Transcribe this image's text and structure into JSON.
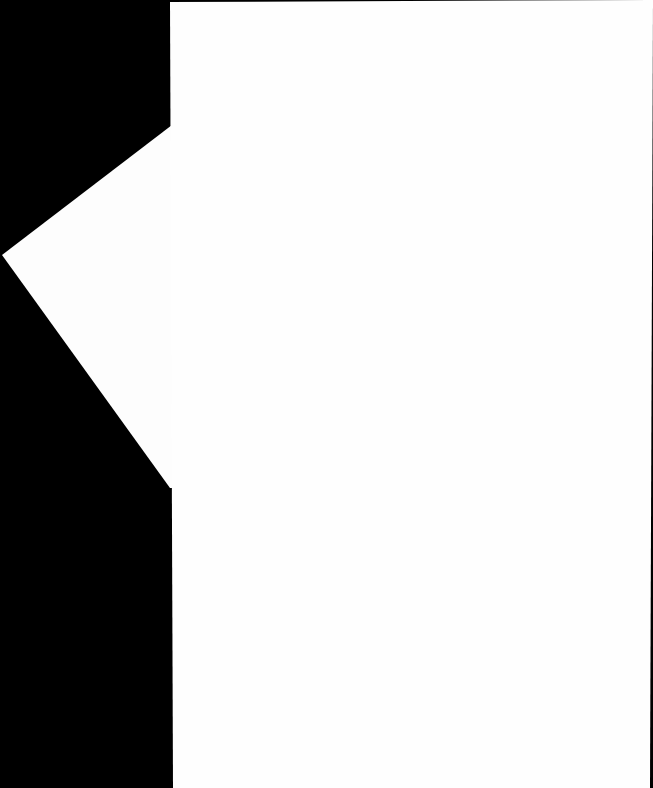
{
  "scene": {
    "background_color": "#000000",
    "back_sheet": {
      "color": "#fdfdfd",
      "points": "172,125 2,255 170,488 172,488"
    },
    "front_sheet": {
      "color": "#fefefe",
      "points": "170,2 653,0 650,788 173,788"
    }
  }
}
